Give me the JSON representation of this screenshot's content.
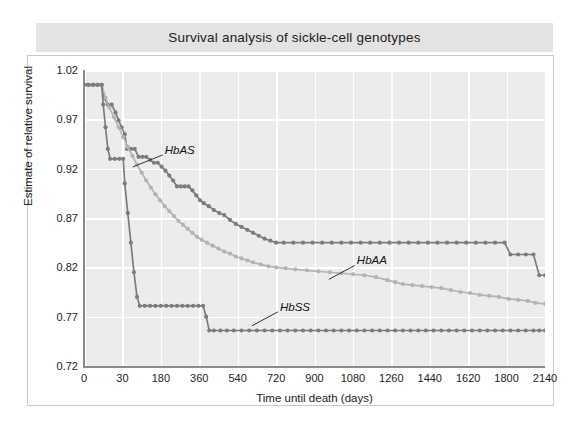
{
  "title": "Survival analysis of sickle-cell genotypes",
  "chart_data": {
    "type": "line",
    "title": "Survival analysis of sickle-cell genotypes",
    "xlabel": "Time until death (days)",
    "ylabel": "Estimate of relative survival",
    "grid": true,
    "legend_position": "inline-annotations",
    "xtick_labels": [
      "0",
      "30",
      "180",
      "360",
      "540",
      "720",
      "900",
      "1080",
      "1260",
      "1440",
      "1620",
      "1800",
      "2140"
    ],
    "ytick_labels": [
      "1.02",
      "0.97",
      "0.92",
      "0.87",
      "0.82",
      "0.77",
      "0.72"
    ],
    "ylim": [
      0.72,
      1.02
    ],
    "xlim_index": [
      0,
      12
    ],
    "x_spacing": "even (categorical tick positions)",
    "annotations": [
      {
        "text": "HbAS",
        "x_index": 2.05,
        "y": 0.938
      },
      {
        "text": "HbAA",
        "x_index": 7.05,
        "y": 0.826
      },
      {
        "text": "HbSS",
        "x_index": 5.05,
        "y": 0.779
      }
    ],
    "series": [
      {
        "name": "HbAS",
        "color": "#7c7c7c",
        "marker": "circle",
        "points": [
          [
            0.0,
            1.005
          ],
          [
            0.1,
            1.005
          ],
          [
            0.22,
            1.005
          ],
          [
            0.34,
            1.005
          ],
          [
            0.46,
            1.005
          ],
          [
            0.52,
            0.992
          ],
          [
            0.62,
            0.985
          ],
          [
            0.72,
            0.985
          ],
          [
            0.82,
            0.977
          ],
          [
            0.9,
            0.969
          ],
          [
            0.98,
            0.962
          ],
          [
            1.06,
            0.955
          ],
          [
            1.12,
            0.94
          ],
          [
            1.22,
            0.94
          ],
          [
            1.32,
            0.94
          ],
          [
            1.42,
            0.932
          ],
          [
            1.52,
            0.932
          ],
          [
            1.62,
            0.932
          ],
          [
            1.72,
            0.929
          ],
          [
            1.82,
            0.926
          ],
          [
            1.92,
            0.926
          ],
          [
            2.02,
            0.922
          ],
          [
            2.12,
            0.918
          ],
          [
            2.22,
            0.913
          ],
          [
            2.32,
            0.908
          ],
          [
            2.42,
            0.902
          ],
          [
            2.52,
            0.902
          ],
          [
            2.62,
            0.902
          ],
          [
            2.72,
            0.902
          ],
          [
            2.82,
            0.898
          ],
          [
            2.92,
            0.893
          ],
          [
            3.02,
            0.888
          ],
          [
            3.12,
            0.885
          ],
          [
            3.25,
            0.882
          ],
          [
            3.38,
            0.878
          ],
          [
            3.52,
            0.875
          ],
          [
            3.65,
            0.873
          ],
          [
            3.8,
            0.868
          ],
          [
            3.95,
            0.864
          ],
          [
            4.1,
            0.861
          ],
          [
            4.25,
            0.858
          ],
          [
            4.4,
            0.855
          ],
          [
            4.55,
            0.852
          ],
          [
            4.7,
            0.849
          ],
          [
            4.85,
            0.847
          ],
          [
            5.0,
            0.845
          ],
          [
            5.2,
            0.845
          ],
          [
            5.45,
            0.845
          ],
          [
            5.7,
            0.845
          ],
          [
            5.95,
            0.845
          ],
          [
            6.2,
            0.845
          ],
          [
            6.45,
            0.845
          ],
          [
            6.7,
            0.845
          ],
          [
            6.95,
            0.845
          ],
          [
            7.2,
            0.845
          ],
          [
            7.45,
            0.845
          ],
          [
            7.7,
            0.845
          ],
          [
            7.95,
            0.845
          ],
          [
            8.2,
            0.845
          ],
          [
            8.45,
            0.845
          ],
          [
            8.7,
            0.845
          ],
          [
            8.95,
            0.845
          ],
          [
            9.2,
            0.845
          ],
          [
            9.45,
            0.845
          ],
          [
            9.7,
            0.845
          ],
          [
            9.95,
            0.845
          ],
          [
            10.2,
            0.845
          ],
          [
            10.45,
            0.845
          ],
          [
            10.7,
            0.845
          ],
          [
            10.95,
            0.845
          ],
          [
            11.1,
            0.833
          ],
          [
            11.3,
            0.833
          ],
          [
            11.5,
            0.833
          ],
          [
            11.7,
            0.833
          ],
          [
            11.85,
            0.812
          ],
          [
            12.0,
            0.812
          ]
        ]
      },
      {
        "name": "HbAA",
        "color": "#b3b3b3",
        "marker": "circle",
        "points": [
          [
            0.0,
            1.005
          ],
          [
            0.12,
            1.005
          ],
          [
            0.24,
            1.005
          ],
          [
            0.36,
            1.005
          ],
          [
            0.46,
            1.005
          ],
          [
            0.56,
            0.992
          ],
          [
            0.66,
            0.982
          ],
          [
            0.78,
            0.972
          ],
          [
            0.9,
            0.962
          ],
          [
            1.02,
            0.952
          ],
          [
            1.14,
            0.942
          ],
          [
            1.26,
            0.933
          ],
          [
            1.38,
            0.924
          ],
          [
            1.5,
            0.916
          ],
          [
            1.62,
            0.908
          ],
          [
            1.74,
            0.901
          ],
          [
            1.86,
            0.894
          ],
          [
            1.98,
            0.888
          ],
          [
            2.1,
            0.882
          ],
          [
            2.22,
            0.877
          ],
          [
            2.34,
            0.872
          ],
          [
            2.46,
            0.867
          ],
          [
            2.58,
            0.863
          ],
          [
            2.7,
            0.859
          ],
          [
            2.82,
            0.855
          ],
          [
            2.94,
            0.851
          ],
          [
            3.06,
            0.848
          ],
          [
            3.2,
            0.845
          ],
          [
            3.35,
            0.842
          ],
          [
            3.5,
            0.839
          ],
          [
            3.65,
            0.836
          ],
          [
            3.8,
            0.834
          ],
          [
            3.95,
            0.831
          ],
          [
            4.1,
            0.829
          ],
          [
            4.25,
            0.827
          ],
          [
            4.4,
            0.825
          ],
          [
            4.6,
            0.823
          ],
          [
            4.8,
            0.821
          ],
          [
            5.0,
            0.82
          ],
          [
            5.25,
            0.819
          ],
          [
            5.5,
            0.818
          ],
          [
            5.8,
            0.817
          ],
          [
            6.1,
            0.816
          ],
          [
            6.4,
            0.815
          ],
          [
            6.7,
            0.814
          ],
          [
            7.0,
            0.813
          ],
          [
            7.3,
            0.812
          ],
          [
            7.6,
            0.81
          ],
          [
            7.9,
            0.807
          ],
          [
            8.1,
            0.805
          ],
          [
            8.3,
            0.803
          ],
          [
            8.55,
            0.802
          ],
          [
            8.8,
            0.801
          ],
          [
            9.05,
            0.8
          ],
          [
            9.3,
            0.799
          ],
          [
            9.55,
            0.797
          ],
          [
            9.8,
            0.795
          ],
          [
            10.05,
            0.794
          ],
          [
            10.3,
            0.792
          ],
          [
            10.55,
            0.791
          ],
          [
            10.8,
            0.79
          ],
          [
            11.05,
            0.788
          ],
          [
            11.3,
            0.787
          ],
          [
            11.55,
            0.786
          ],
          [
            11.75,
            0.784
          ],
          [
            12.0,
            0.783
          ]
        ]
      },
      {
        "name": "HbSS",
        "color": "#7c7c7c",
        "marker": "circle",
        "points": [
          [
            0.0,
            1.005
          ],
          [
            0.12,
            1.005
          ],
          [
            0.24,
            1.005
          ],
          [
            0.36,
            1.005
          ],
          [
            0.46,
            1.005
          ],
          [
            0.5,
            0.985
          ],
          [
            0.56,
            0.962
          ],
          [
            0.62,
            0.94
          ],
          [
            0.68,
            0.93
          ],
          [
            0.8,
            0.93
          ],
          [
            0.92,
            0.93
          ],
          [
            1.02,
            0.93
          ],
          [
            1.06,
            0.905
          ],
          [
            1.14,
            0.875
          ],
          [
            1.22,
            0.845
          ],
          [
            1.3,
            0.815
          ],
          [
            1.38,
            0.79
          ],
          [
            1.45,
            0.781
          ],
          [
            1.58,
            0.781
          ],
          [
            1.72,
            0.781
          ],
          [
            1.86,
            0.781
          ],
          [
            2.0,
            0.781
          ],
          [
            2.14,
            0.781
          ],
          [
            2.28,
            0.781
          ],
          [
            2.42,
            0.781
          ],
          [
            2.56,
            0.781
          ],
          [
            2.7,
            0.781
          ],
          [
            2.84,
            0.781
          ],
          [
            2.98,
            0.781
          ],
          [
            3.1,
            0.781
          ],
          [
            3.18,
            0.77
          ],
          [
            3.26,
            0.756
          ],
          [
            3.38,
            0.756
          ],
          [
            3.55,
            0.756
          ],
          [
            3.72,
            0.756
          ],
          [
            3.9,
            0.756
          ],
          [
            4.1,
            0.756
          ],
          [
            4.3,
            0.756
          ],
          [
            4.5,
            0.756
          ],
          [
            4.7,
            0.756
          ],
          [
            4.9,
            0.756
          ],
          [
            5.1,
            0.756
          ],
          [
            5.3,
            0.756
          ],
          [
            5.5,
            0.756
          ],
          [
            5.7,
            0.756
          ],
          [
            5.9,
            0.756
          ],
          [
            6.1,
            0.756
          ],
          [
            6.3,
            0.756
          ],
          [
            6.5,
            0.756
          ],
          [
            6.7,
            0.756
          ],
          [
            6.9,
            0.756
          ],
          [
            7.1,
            0.756
          ],
          [
            7.3,
            0.756
          ],
          [
            7.5,
            0.756
          ],
          [
            7.7,
            0.756
          ],
          [
            7.9,
            0.756
          ],
          [
            8.1,
            0.756
          ],
          [
            8.3,
            0.756
          ],
          [
            8.5,
            0.756
          ],
          [
            8.7,
            0.756
          ],
          [
            8.9,
            0.756
          ],
          [
            9.1,
            0.756
          ],
          [
            9.3,
            0.756
          ],
          [
            9.5,
            0.756
          ],
          [
            9.7,
            0.756
          ],
          [
            9.9,
            0.756
          ],
          [
            10.1,
            0.756
          ],
          [
            10.3,
            0.756
          ],
          [
            10.5,
            0.756
          ],
          [
            10.7,
            0.756
          ],
          [
            10.9,
            0.756
          ],
          [
            11.1,
            0.756
          ],
          [
            11.3,
            0.756
          ],
          [
            11.5,
            0.756
          ],
          [
            11.7,
            0.756
          ],
          [
            11.85,
            0.756
          ],
          [
            12.0,
            0.756
          ]
        ]
      }
    ]
  },
  "colors": {
    "title_band": "#e3e3e3",
    "plot_background": "#ececec",
    "gridline": "#ffffff",
    "axis": "#8a8a8a",
    "series_dark": "#7c7c7c",
    "series_light": "#b3b3b3"
  }
}
